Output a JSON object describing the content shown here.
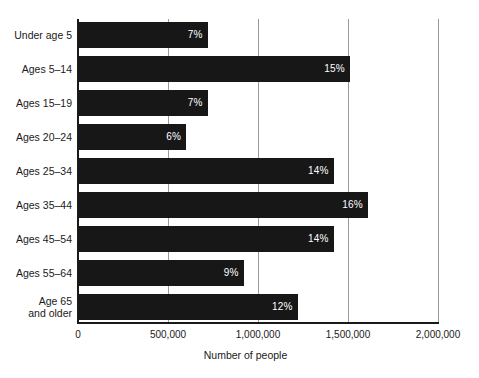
{
  "chart_data": {
    "type": "bar",
    "orientation": "horizontal",
    "title": "",
    "xlabel": "Number of people",
    "ylabel": "",
    "xlim": [
      0,
      2000000
    ],
    "grid": true,
    "legend": null,
    "xticks": [
      {
        "value": 0,
        "label": "0"
      },
      {
        "value": 500000,
        "label": "500,000"
      },
      {
        "value": 1000000,
        "label": "1,000,000"
      },
      {
        "value": 1500000,
        "label": "1,500,000"
      },
      {
        "value": 2000000,
        "label": "2,000,000"
      }
    ],
    "categories": [
      "Under age 5",
      "Ages 5–14",
      "Ages 15–19",
      "Ages 20–24",
      "Ages 25–34",
      "Ages 35–44",
      "Ages 45–54",
      "Ages 55–64",
      "Age 65\nand older"
    ],
    "values": [
      720000,
      1510000,
      720000,
      600000,
      1420000,
      1610000,
      1420000,
      920000,
      1220000
    ],
    "data_labels": [
      "7%",
      "15%",
      "7%",
      "6%",
      "14%",
      "16%",
      "14%",
      "9%",
      "12%"
    ],
    "bar_color": "#171717",
    "data_label_color": "#ffffff",
    "gridline_color": "#9a9a9a",
    "axis_color": "#1a1a1a",
    "background_color": "#ffffff"
  }
}
